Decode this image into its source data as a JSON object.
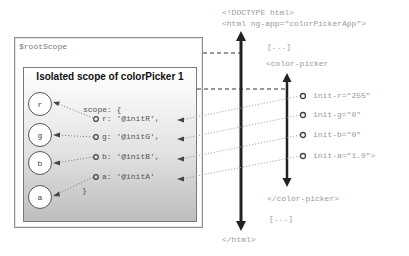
{
  "root_scope": {
    "label": "$rootScope"
  },
  "isolated_scope": {
    "title": "Isolated scope of colorPicker 1",
    "nodes": [
      {
        "label": "r"
      },
      {
        "label": "g"
      },
      {
        "label": "b"
      },
      {
        "label": "a"
      }
    ],
    "scope_open": "scope: {",
    "properties": [
      {
        "text": "r: '@initR',"
      },
      {
        "text": "g: '@initG',"
      },
      {
        "text": "b: '@initB',"
      },
      {
        "text": "a: '@initA'"
      }
    ],
    "scope_close": "}"
  },
  "html_markup": {
    "doctype": "<!DOCTYPE html>",
    "html_open": "<html ng-app=\"colorPickerApp\">",
    "ellipsis_top": "[...]",
    "color_picker_open": "<color-picker",
    "attributes": [
      {
        "text": "init-r=\"255\""
      },
      {
        "text": "init-g=\"0\""
      },
      {
        "text": "init-b=\"0\""
      },
      {
        "text": "init-a=\"1.0\">"
      }
    ],
    "color_picker_close": "</color-picker>",
    "ellipsis_bottom": "[...]",
    "html_close": "</html>"
  },
  "colors": {
    "arrow": "#222222",
    "dashed_line": "#333333",
    "dotted_line": "#999999",
    "markup_text": "#8a8a8a"
  }
}
